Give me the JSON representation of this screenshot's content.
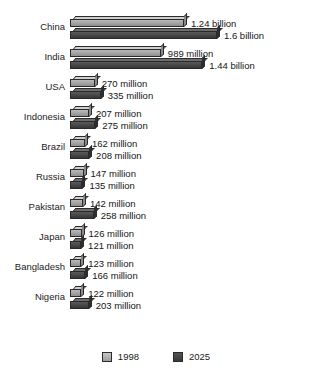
{
  "chart_data": {
    "type": "bar",
    "orientation": "horizontal",
    "title": "",
    "xlabel": "",
    "ylabel": "",
    "grid": false,
    "legend_position": "bottom-center",
    "xlim": [
      0,
      1600
    ],
    "unit_note": "values in millions of people",
    "categories": [
      "China",
      "India",
      "USA",
      "Indonesia",
      "Brazil",
      "Russia",
      "Pakistan",
      "Japan",
      "Bangladesh",
      "Nigeria"
    ],
    "series": [
      {
        "name": "1998",
        "color": "#a3a3a3",
        "values": [
          1240,
          989,
          270,
          207,
          162,
          147,
          142,
          126,
          123,
          122
        ],
        "labels": [
          "1.24 billion",
          "989 million",
          "270 million",
          "207 million",
          "162 million",
          "147 million",
          "142 million",
          "126 million",
          "123 million",
          "122 million"
        ]
      },
      {
        "name": "2025",
        "color": "#464646",
        "values": [
          1600,
          1440,
          335,
          275,
          208,
          135,
          258,
          121,
          166,
          203
        ],
        "labels": [
          "1.6 billion",
          "1.44 billion",
          "335 million",
          "275 million",
          "208 million",
          "135 million",
          "258 million",
          "121 million",
          "166 million",
          "203 million"
        ]
      }
    ]
  },
  "legend": {
    "items": [
      {
        "label": "1998",
        "swatch": "light-gray-swatch"
      },
      {
        "label": "2025",
        "swatch": "dark-gray-swatch"
      }
    ]
  },
  "caption": {
    "text": ""
  }
}
